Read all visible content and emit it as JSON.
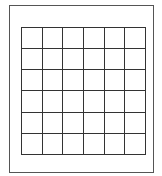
{
  "grid": {
    "rows": 6,
    "columns": 6,
    "line_color": "#333333",
    "frame_color": "#555555",
    "background": "#ffffff"
  }
}
